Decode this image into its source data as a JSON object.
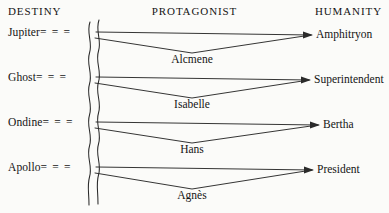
{
  "headers": {
    "left": "DESTINY",
    "center": "PROTAGONIST",
    "right": "HUMANITY"
  },
  "connector": {
    "dashes": "= = =",
    "lead": "-"
  },
  "colors": {
    "ink": "#1a1a1a",
    "background": "#fbfbf9",
    "line": "#2a2a2a"
  },
  "rows": [
    {
      "destiny": "Jupiter",
      "protagonist": "Alcmene",
      "humanity": "Amphitryon"
    },
    {
      "destiny": "Ghost",
      "protagonist": "Isabelle",
      "humanity": "Superintendent"
    },
    {
      "destiny": "Ondine",
      "protagonist": "Hans",
      "humanity": "Bertha"
    },
    {
      "destiny": "Apollo",
      "protagonist": "Agnès",
      "humanity": "President"
    }
  ]
}
